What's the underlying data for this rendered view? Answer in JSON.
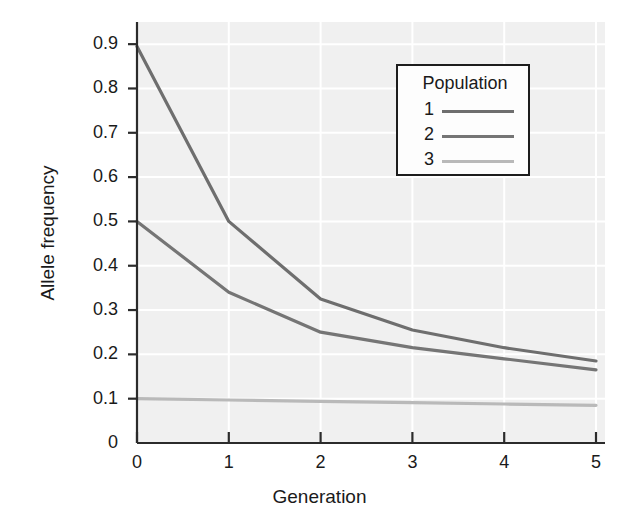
{
  "chart_data": {
    "type": "line",
    "title": "",
    "xlabel": "Generation",
    "ylabel": "Allele frequency",
    "x": [
      0,
      1,
      2,
      3,
      4,
      5
    ],
    "xlim": [
      0,
      5
    ],
    "ylim": [
      0,
      0.95
    ],
    "xticks": [
      "0",
      "1",
      "2",
      "3",
      "4",
      "5"
    ],
    "yticks": [
      "0",
      "0.1",
      "0.2",
      "0.3",
      "0.4",
      "0.5",
      "0.6",
      "0.7",
      "0.8",
      "0.9"
    ],
    "ytick_values": [
      0,
      0.1,
      0.2,
      0.3,
      0.4,
      0.5,
      0.6,
      0.7,
      0.8,
      0.9
    ],
    "grid": true,
    "grid_color": "#ffffff",
    "plot_background": "#f0f0f0",
    "legend_position": "upper right",
    "legend_title": "Population",
    "series": [
      {
        "name": "1",
        "color": "#6e6e6e",
        "values": [
          0.895,
          0.5,
          0.325,
          0.255,
          0.215,
          0.185
        ]
      },
      {
        "name": "2",
        "color": "#757575",
        "values": [
          0.5,
          0.34,
          0.25,
          0.215,
          0.19,
          0.165
        ]
      },
      {
        "name": "3",
        "color": "#b9b9b9",
        "values": [
          0.1,
          0.097,
          0.094,
          0.091,
          0.088,
          0.085
        ]
      }
    ]
  },
  "legend": {
    "title": "Population",
    "entries": [
      {
        "label": "1",
        "color": "#6e6e6e"
      },
      {
        "label": "2",
        "color": "#757575"
      },
      {
        "label": "3",
        "color": "#b9b9b9"
      }
    ]
  },
  "axes": {
    "x_title": "Generation",
    "y_title": "Allele frequency",
    "x_tick_labels": [
      "0",
      "1",
      "2",
      "3",
      "4",
      "5"
    ],
    "y_tick_labels": [
      "0.9",
      "0.8",
      "0.7",
      "0.6",
      "0.5",
      "0.4",
      "0.3",
      "0.2",
      "0.1",
      "0"
    ]
  }
}
